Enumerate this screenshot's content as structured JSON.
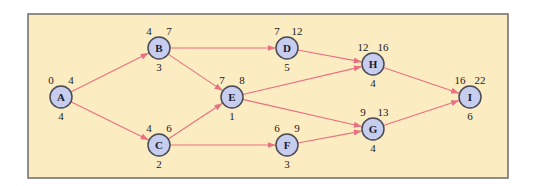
{
  "colors": {
    "background": "#fcecc2",
    "frame": "#6b6b6b",
    "node_fill": "#c6cdee",
    "node_stroke": "#4a4a55",
    "edge": "#ea6f80",
    "text": "#222222"
  },
  "frame": {
    "x": 28,
    "y": 14,
    "width": 480,
    "height": 164
  },
  "node_radius": 11,
  "nodes": [
    {
      "id": "A",
      "label": "A",
      "x": 61,
      "y": 97,
      "early_start": "0",
      "early_finish": "4",
      "duration": "4"
    },
    {
      "id": "B",
      "label": "B",
      "x": 159,
      "y": 48,
      "early_start": "4",
      "early_finish": "7",
      "duration": "3"
    },
    {
      "id": "C",
      "label": "C",
      "x": 159,
      "y": 145,
      "early_start": "4",
      "early_finish": "6",
      "duration": "2"
    },
    {
      "id": "D",
      "label": "D",
      "x": 287,
      "y": 48,
      "early_start": "7",
      "early_finish": "12",
      "duration": "5"
    },
    {
      "id": "E",
      "label": "E",
      "x": 232,
      "y": 97,
      "early_start": "7",
      "early_finish": "8",
      "duration": "1"
    },
    {
      "id": "F",
      "label": "F",
      "x": 287,
      "y": 145,
      "early_start": "6",
      "early_finish": "9",
      "duration": "3"
    },
    {
      "id": "G",
      "label": "G",
      "x": 373,
      "y": 129,
      "early_start": "9",
      "early_finish": "13",
      "duration": "4"
    },
    {
      "id": "H",
      "label": "H",
      "x": 373,
      "y": 64,
      "early_start": "12",
      "early_finish": "16",
      "duration": "4"
    },
    {
      "id": "I",
      "label": "I",
      "x": 470,
      "y": 97,
      "early_start": "16",
      "early_finish": "22",
      "duration": "6"
    }
  ],
  "edges": [
    {
      "from": "A",
      "to": "B"
    },
    {
      "from": "A",
      "to": "C"
    },
    {
      "from": "B",
      "to": "D"
    },
    {
      "from": "B",
      "to": "E"
    },
    {
      "from": "C",
      "to": "E"
    },
    {
      "from": "C",
      "to": "F"
    },
    {
      "from": "D",
      "to": "H"
    },
    {
      "from": "E",
      "to": "H"
    },
    {
      "from": "E",
      "to": "G"
    },
    {
      "from": "F",
      "to": "G"
    },
    {
      "from": "H",
      "to": "I"
    },
    {
      "from": "G",
      "to": "I"
    }
  ]
}
